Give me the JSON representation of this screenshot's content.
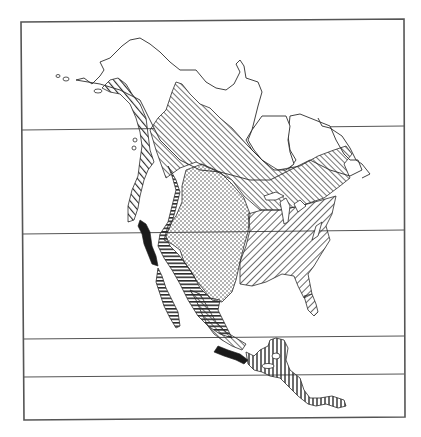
{
  "map": {
    "title": "",
    "subject": "North America vegetation zones (monochrome hatch map)",
    "has_visible_text": false,
    "frame": {
      "x": 21,
      "y": 20,
      "width": 383,
      "height": 399,
      "stroke": "#555555"
    },
    "latitude_lines_y": [
      130,
      234,
      339,
      377
    ],
    "colors": {
      "ink": "#2b2b2b",
      "paper": "#ffffff",
      "frame": "#555555"
    },
    "legend_zones": [
      {
        "id": "tundra",
        "pattern": "blank"
      },
      {
        "id": "boreal-forest",
        "pattern": "diagonal-fine"
      },
      {
        "id": "coastal-forest",
        "pattern": "diagonal-bold"
      },
      {
        "id": "temperate-deciduous",
        "pattern": "diagonal-wide"
      },
      {
        "id": "grassland",
        "pattern": "dots"
      },
      {
        "id": "desert-scrub",
        "pattern": "horizontal"
      },
      {
        "id": "mediterranean-chaparral",
        "pattern": "solid-black"
      },
      {
        "id": "tropical-forest",
        "pattern": "vertical"
      }
    ]
  }
}
